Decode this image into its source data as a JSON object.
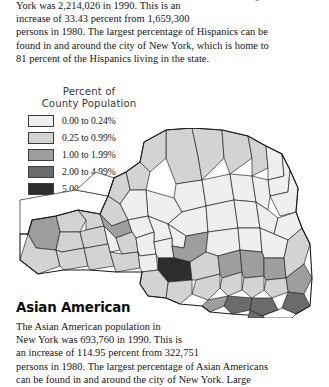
{
  "page": {
    "background": "#ffffff",
    "text_color": "#141414"
  },
  "hispanic_section": {
    "lines": [
      "York was 2,214,026 in 1990. This is an",
      "increase of 33.43 percent from 1,659,300",
      "persons in 1980. The largest percentage of Hispanics can be",
      "found in and around the city of New York, which is home to",
      "81 percent of the Hispanics living in the state."
    ],
    "stats": {
      "population_1990": "2,214,026",
      "year_1990": "1990",
      "percent_increase": "33.43 percent",
      "population_1980": "1,659,300",
      "year_1980": "1980",
      "metro_share": "81 percent",
      "metro_area": "city of New York"
    }
  },
  "legend": {
    "title_line_1": "Percent of",
    "title_line_2": "County Population",
    "classes": [
      {
        "label": "0.00 to 0.24%",
        "color": "#efefef",
        "min": 0.0,
        "max": 0.24
      },
      {
        "label": "0.25 to 0.99%",
        "color": "#d3d3d3",
        "min": 0.25,
        "max": 0.99
      },
      {
        "label": "1.00 to 1.99%",
        "color": "#9e9e9e",
        "min": 1.0,
        "max": 1.99
      },
      {
        "label": "2.00 to 4.99%",
        "color": "#6b6b6b",
        "min": 2.0,
        "max": 4.99
      },
      {
        "label": "5.00 to 76.92%",
        "color": "#2d2d2d",
        "min": 5.0,
        "max": 76.92
      }
    ]
  },
  "map": {
    "subject": "New York State counties",
    "variable": "Percent of county population",
    "border_color": "#262626"
  },
  "asian_section": {
    "heading": "Asian American",
    "lines": [
      "The Asian American population in",
      "New York was 693,760 in 1990. This is",
      "an increase of 114.95 percent from 322,751",
      "persons in 1980. The largest percentage of Asian Americans",
      "can be found in and around the city of New York. Large"
    ],
    "stats": {
      "population_1990": "693,760",
      "year_1990": "1990",
      "percent_increase": "114.95 percent",
      "population_1980": "322,751",
      "year_1980": "1980",
      "metro_area": "city of New York"
    }
  }
}
